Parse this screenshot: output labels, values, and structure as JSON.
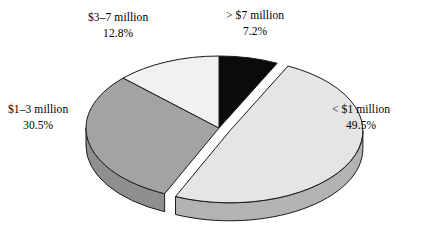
{
  "chart_data": {
    "type": "pie",
    "title": "",
    "subtitle": "",
    "xlabel": "",
    "ylabel": "",
    "grid": false,
    "legend_position": "none",
    "style": "3d-exploded-pie",
    "start_angle_deg": 0,
    "direction": "clockwise",
    "categories": [
      "> $7 million",
      "< $1 million",
      "$1–3 million",
      "$3–7 million"
    ],
    "values": [
      7.2,
      49.5,
      30.5,
      12.8
    ],
    "value_unit": "%",
    "slices": [
      {
        "label": "> $7 million",
        "percent_text": "7.2%",
        "value": 7.2,
        "color": "#0b0b0b",
        "side_color": "#0b0b0b",
        "exploded": false,
        "label_position": "top-right"
      },
      {
        "label": "< $1 million",
        "percent_text": "49.5%",
        "value": 49.5,
        "color": "#e5e5e5",
        "side_color": "#b3b3b3",
        "exploded": true,
        "label_position": "right"
      },
      {
        "label": "$1–3 million",
        "percent_text": "30.5%",
        "value": 30.5,
        "color": "#a3a3a3",
        "side_color": "#8f8f8f",
        "exploded": false,
        "label_position": "left"
      },
      {
        "label": "$3–7 million",
        "percent_text": "12.8%",
        "value": 12.8,
        "color": "#f1f1f1",
        "side_color": "#cfcfcf",
        "exploded": false,
        "label_position": "top-left"
      }
    ],
    "colors": {
      "background": "#ffffff",
      "outline": "#1a1a1a",
      "text": "#000000"
    }
  },
  "labels": {
    "gt7": {
      "name": "> $7 million",
      "pct": "7.2%"
    },
    "lt1": {
      "name": "< $1 million",
      "pct": "49.5%"
    },
    "mid13": {
      "name": "$1–3 million",
      "pct": "30.5%"
    },
    "mid37": {
      "name": "$3–7 million",
      "pct": "12.8%"
    }
  }
}
